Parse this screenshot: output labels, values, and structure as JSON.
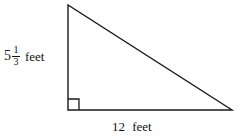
{
  "figure": {
    "type": "right-triangle-diagram",
    "background_color": "#ffffff",
    "stroke_color": "#1a1a1a"
  },
  "geometry": {
    "apex": {
      "x": 68,
      "y": 5
    },
    "right_angle_vertex": {
      "x": 68,
      "y": 110
    },
    "right_vertex": {
      "x": 232,
      "y": 110
    },
    "right_angle_marker_size": 11
  },
  "labels": {
    "height": {
      "whole": "5",
      "numerator": "1",
      "denominator": "3",
      "unit": "feet",
      "full_text": "5 1/3 feet"
    },
    "base": {
      "value": "12",
      "unit": "feet",
      "full_text": "12 feet"
    }
  }
}
